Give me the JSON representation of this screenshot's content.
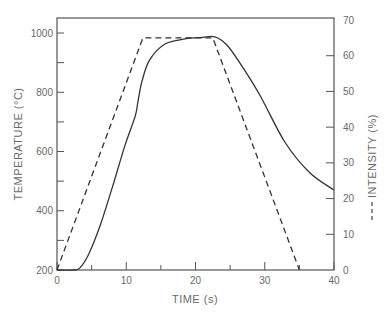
{
  "chart_data": {
    "type": "line",
    "title": "",
    "xlabel": "TIME (s)",
    "ylabel": "TEMPERATURE (°C)",
    "y2label": "INTENSITY (%)",
    "xlim": [
      0,
      40
    ],
    "ylim": [
      200,
      1050
    ],
    "y2lim": [
      0,
      70
    ],
    "x_ticks": [
      0,
      10,
      20,
      30,
      40
    ],
    "x_minor_ticks": [
      5,
      15,
      25,
      35
    ],
    "y_ticks": [
      200,
      400,
      600,
      800,
      1000
    ],
    "y_minor_ticks": [
      300,
      500,
      700,
      900
    ],
    "y2_ticks": [
      0,
      10,
      20,
      30,
      40,
      50,
      60,
      70
    ],
    "grid": false,
    "legend": "inline on right axis label (dashed line = intensity)",
    "series": [
      {
        "name": "Temperature",
        "axis": "left",
        "style": "solid",
        "x": [
          0,
          2.5,
          3.3,
          4.5,
          6.2,
          8.0,
          9.8,
          11.3,
          11.7,
          12.3,
          13.4,
          15.6,
          18.5,
          21.0,
          22.8,
          24.5,
          26.4,
          29.3,
          32.9,
          36.5,
          40
        ],
        "y": [
          200,
          200,
          207,
          250,
          348,
          480,
          620,
          720,
          770,
          840,
          910,
          963,
          980,
          985,
          987,
          960,
          899,
          790,
          632,
          528,
          470
        ]
      },
      {
        "name": "Intensity",
        "axis": "right",
        "style": "dashed",
        "x": [
          0,
          12.4,
          22.5,
          35.0
        ],
        "y": [
          0,
          65,
          65,
          0
        ]
      }
    ]
  },
  "labels": {
    "x_axis_title": "TIME (s)",
    "y_axis_title": "TEMPERATURE (°C)",
    "y2_axis_title": "INTENSITY (%)"
  }
}
